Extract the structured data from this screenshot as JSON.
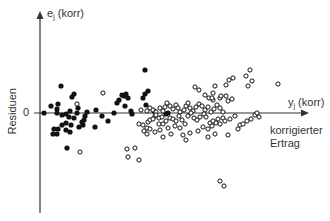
{
  "chart_data": {
    "type": "scatter",
    "title": "",
    "ylabel": "e_j (korr)",
    "ylabel_side": "Residuen",
    "xlabel": "y_j (korr)",
    "xlabel_sub": "korrigierter Ertrag",
    "y_zero_label": "0",
    "grid": false,
    "legend": null,
    "axes": {
      "origin_px": [
        40,
        113
      ],
      "y_axis_top_px": 14,
      "y_axis_bottom_px": 213,
      "x_axis_right_px": 308
    },
    "series": [
      {
        "name": "filled",
        "marker": "filled-circle",
        "color": "#111111",
        "points_px": [
          [
            44,
            113
          ],
          [
            51,
            106
          ],
          [
            57,
            109
          ],
          [
            57,
            113
          ],
          [
            58,
            104
          ],
          [
            61,
            86
          ],
          [
            62,
            115
          ],
          [
            66,
            114
          ],
          [
            70,
            111
          ],
          [
            72,
            97
          ],
          [
            74,
            94
          ],
          [
            74,
            118
          ],
          [
            77,
            113
          ],
          [
            78,
            108
          ],
          [
            53,
            134
          ],
          [
            54,
            129
          ],
          [
            57,
            134
          ],
          [
            58,
            129
          ],
          [
            62,
            125
          ],
          [
            66,
            130
          ],
          [
            66,
            123
          ],
          [
            69,
            117
          ],
          [
            71,
            125
          ],
          [
            70,
            132
          ],
          [
            79,
            127
          ],
          [
            82,
            122
          ],
          [
            83,
            125
          ],
          [
            84,
            120
          ],
          [
            85,
            116
          ],
          [
            87,
            112
          ],
          [
            95,
            127
          ],
          [
            96,
            110
          ],
          [
            102,
            116
          ],
          [
            108,
            121
          ],
          [
            67,
            148
          ],
          [
            114,
            113
          ],
          [
            117,
            103
          ],
          [
            119,
            100
          ],
          [
            122,
            95
          ],
          [
            124,
            96
          ],
          [
            126,
            94
          ],
          [
            128,
            98
          ],
          [
            125,
            106
          ],
          [
            131,
            111
          ],
          [
            132,
            114
          ],
          [
            143,
            98
          ],
          [
            145,
            94
          ],
          [
            145,
            70
          ],
          [
            146,
            105
          ],
          [
            148,
            91
          ],
          [
            154,
            111
          ],
          [
            166,
            114
          ],
          [
            168,
            113
          ]
        ]
      },
      {
        "name": "open",
        "marker": "open-circle",
        "color": "#111111",
        "points_px": [
          [
            77,
            104
          ],
          [
            80,
            152
          ],
          [
            103,
            93
          ],
          [
            141,
            110
          ],
          [
            147,
            111
          ],
          [
            150,
            108
          ],
          [
            153,
            110
          ],
          [
            156,
            112
          ],
          [
            155,
            116
          ],
          [
            160,
            108
          ],
          [
            163,
            111
          ],
          [
            165,
            107
          ],
          [
            167,
            103
          ],
          [
            170,
            106
          ],
          [
            173,
            109
          ],
          [
            176,
            105
          ],
          [
            178,
            108
          ],
          [
            180,
            112
          ],
          [
            184,
            110
          ],
          [
            186,
            106
          ],
          [
            188,
            103
          ],
          [
            190,
            108
          ],
          [
            193,
            111
          ],
          [
            196,
            107
          ],
          [
            199,
            104
          ],
          [
            202,
            106
          ],
          [
            205,
            110
          ],
          [
            208,
            107
          ],
          [
            211,
            112
          ],
          [
            214,
            109
          ],
          [
            217,
            105
          ],
          [
            220,
            108
          ],
          [
            223,
            112
          ],
          [
            220,
            98
          ],
          [
            221,
            96
          ],
          [
            226,
            96
          ],
          [
            228,
            101
          ],
          [
            232,
            99
          ],
          [
            195,
            87
          ],
          [
            199,
            90
          ],
          [
            205,
            95
          ],
          [
            213,
            93
          ],
          [
            215,
            86
          ],
          [
            213,
            100
          ],
          [
            209,
            98
          ],
          [
            212,
            98
          ],
          [
            226,
            85
          ],
          [
            229,
            80
          ],
          [
            233,
            78
          ],
          [
            246,
            76
          ],
          [
            250,
            70
          ],
          [
            248,
            86
          ],
          [
            252,
            81
          ],
          [
            278,
            84
          ],
          [
            139,
            124
          ],
          [
            143,
            125
          ],
          [
            147,
            128
          ],
          [
            148,
            122
          ],
          [
            150,
            120
          ],
          [
            153,
            119
          ],
          [
            156,
            115
          ],
          [
            159,
            118
          ],
          [
            162,
            117
          ],
          [
            159,
            124
          ],
          [
            163,
            124
          ],
          [
            166,
            121
          ],
          [
            170,
            118
          ],
          [
            173,
            119
          ],
          [
            176,
            121
          ],
          [
            179,
            116
          ],
          [
            182,
            120
          ],
          [
            185,
            124
          ],
          [
            188,
            116
          ],
          [
            191,
            113
          ],
          [
            194,
            118
          ],
          [
            197,
            120
          ],
          [
            200,
            117
          ],
          [
            204,
            114
          ],
          [
            206,
            117
          ],
          [
            210,
            123
          ],
          [
            208,
            129
          ],
          [
            212,
            126
          ],
          [
            213,
            121
          ],
          [
            216,
            123
          ],
          [
            218,
            119
          ],
          [
            220,
            124
          ],
          [
            223,
            118
          ],
          [
            225,
            121
          ],
          [
            230,
            119
          ],
          [
            235,
            116
          ],
          [
            240,
            125
          ],
          [
            243,
            124
          ],
          [
            247,
            121
          ],
          [
            251,
            119
          ],
          [
            255,
            115
          ],
          [
            257,
            113
          ],
          [
            259,
            117
          ],
          [
            144,
            131
          ],
          [
            150,
            129
          ],
          [
            147,
            134
          ],
          [
            155,
            132
          ],
          [
            160,
            130
          ],
          [
            168,
            128
          ],
          [
            163,
            137
          ],
          [
            171,
            134
          ],
          [
            175,
            126
          ],
          [
            180,
            128
          ],
          [
            183,
            135
          ],
          [
            186,
            140
          ],
          [
            190,
            133
          ],
          [
            198,
            131
          ],
          [
            203,
            127
          ],
          [
            208,
            137
          ],
          [
            215,
            134
          ],
          [
            228,
            135
          ],
          [
            238,
            129
          ],
          [
            127,
            149
          ],
          [
            128,
            157
          ],
          [
            135,
            148
          ],
          [
            139,
            160
          ],
          [
            220,
            181
          ],
          [
            224,
            186
          ]
        ]
      }
    ]
  }
}
